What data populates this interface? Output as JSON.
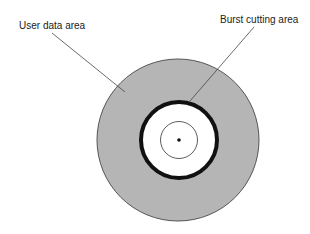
{
  "diagram": {
    "labels": {
      "user_data_area": "User data area",
      "burst_cutting_area": "Burst cutting area"
    },
    "colors": {
      "disc_fill": "#b5b5b5",
      "disc_edge": "#555555",
      "bca_ring": "#111111",
      "hub_fill": "#ffffff",
      "leader_line": "#444444"
    }
  }
}
